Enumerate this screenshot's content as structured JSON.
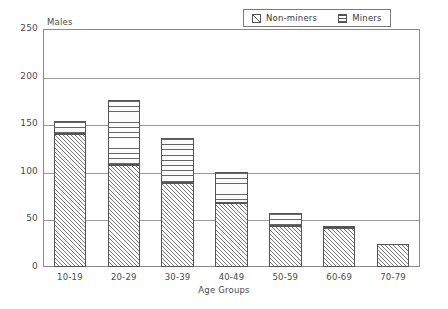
{
  "chart_data": {
    "type": "bar",
    "subtype": "stacked-bar",
    "title": "",
    "xlabel": "Age Groups",
    "ylabel": "Males",
    "categories": [
      "10-19",
      "20-29",
      "30-39",
      "40-49",
      "50-59",
      "60-69",
      "70-79"
    ],
    "series": [
      {
        "name": "Non-miners",
        "values": [
          140,
          107,
          88,
          67,
          43,
          41,
          24
        ]
      },
      {
        "name": "Miners",
        "values": [
          13,
          68,
          48,
          33,
          14,
          2,
          0
        ]
      }
    ],
    "totals": [
      153,
      175,
      136,
      100,
      57,
      43,
      24
    ],
    "ylim": [
      0,
      250
    ],
    "yticks": [
      0,
      50,
      100,
      150,
      200,
      250
    ],
    "ytick_labels": [
      "0",
      "50",
      "100",
      "150",
      "200",
      "250"
    ],
    "grid": true,
    "grid_axis": "y",
    "legend_position": "top-right",
    "legend_entries": [
      {
        "label": "Non-miners",
        "swatch": "diagonal-hatch-icon"
      },
      {
        "label": "Miners",
        "swatch": "horizontal-lines-icon"
      }
    ]
  }
}
